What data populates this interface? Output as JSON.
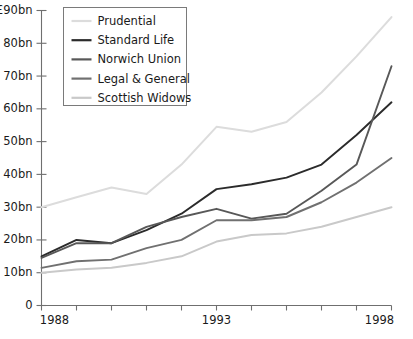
{
  "chart_data": {
    "type": "line",
    "title": "",
    "subtitle": "",
    "xlabel": "",
    "ylabel": "",
    "x": [
      1988,
      1989,
      1990,
      1991,
      1992,
      1993,
      1994,
      1995,
      1996,
      1997,
      1998
    ],
    "xlim": [
      1988,
      1998
    ],
    "ylim": [
      0,
      90
    ],
    "grid": false,
    "legend_position": "top-left",
    "y_axis_top_label": "£90bn",
    "y_ticks": [
      0,
      10,
      20,
      30,
      40,
      50,
      60,
      70,
      80,
      90
    ],
    "y_tick_labels": [
      "0",
      "10bn",
      "20bn",
      "30bn",
      "40bn",
      "50bn",
      "60bn",
      "70bn",
      "80bn",
      "£90bn"
    ],
    "x_ticks": [
      1988,
      1989,
      1990,
      1991,
      1992,
      1993,
      1994,
      1995,
      1996,
      1997,
      1998
    ],
    "x_tick_labels": [
      "1988",
      "",
      "",
      "",
      "",
      "1993",
      "",
      "",
      "",
      "",
      "1998"
    ],
    "series": [
      {
        "name": "Prudential",
        "color": "#dcdcdc",
        "values": [
          30,
          33,
          36,
          34,
          43,
          54.5,
          53,
          56,
          65,
          76,
          88
        ]
      },
      {
        "name": "Standard Life",
        "color": "#2b2b2b",
        "values": [
          15,
          20,
          19,
          23,
          28,
          35.5,
          37,
          39,
          43,
          52,
          62
        ]
      },
      {
        "name": "Norwich Union",
        "color": "#585858",
        "values": [
          14.5,
          19,
          19,
          24,
          27,
          29.5,
          26.5,
          28,
          35,
          43,
          73
        ]
      },
      {
        "name": "Legal & General",
        "color": "#707070",
        "values": [
          11.5,
          13.5,
          14,
          17.5,
          20,
          26,
          26,
          27,
          31.5,
          37.5,
          45
        ]
      },
      {
        "name": "Scottish Widows",
        "color": "#c9c9c9",
        "values": [
          10,
          11,
          11.5,
          13,
          15,
          19.5,
          21.5,
          22,
          24,
          27,
          30
        ]
      }
    ]
  },
  "legend": {
    "entries": [
      {
        "label": "Prudential"
      },
      {
        "label": "Standard Life"
      },
      {
        "label": "Norwich Union"
      },
      {
        "label": "Legal & General"
      },
      {
        "label": "Scottish Widows"
      }
    ]
  }
}
